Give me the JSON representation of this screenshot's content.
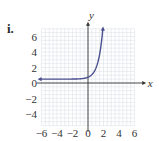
{
  "label": "i.",
  "colors": {
    "curve": "#4a4f8f",
    "grid": "#dfe3ea",
    "axis": "#333333"
  },
  "chart_data": {
    "type": "line",
    "title": "",
    "xlabel": "x",
    "ylabel": "y",
    "xlim": [
      -6,
      6
    ],
    "ylim": [
      -5.5,
      7
    ],
    "grid": true,
    "xticks": [
      "-6",
      "-4",
      "-2",
      "0",
      "2",
      "4",
      "6"
    ],
    "yticks": [
      "6",
      "4",
      "2",
      "0",
      "-2",
      "-4"
    ],
    "series": [
      {
        "name": "exponential curve",
        "x": [
          -6,
          -4,
          -2,
          -1,
          0,
          0.5,
          1,
          1.5,
          1.9
        ],
        "y": [
          0.5,
          0.51,
          0.55,
          0.6,
          0.75,
          1.2,
          2.2,
          4.2,
          7
        ],
        "left_arrow": true,
        "right_arrow": true
      }
    ]
  }
}
